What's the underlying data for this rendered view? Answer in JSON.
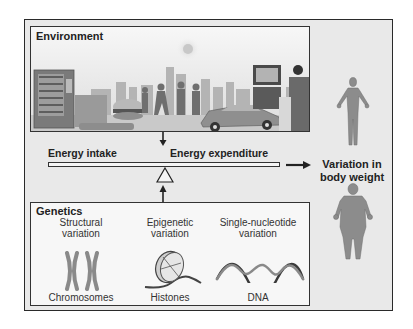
{
  "environment": {
    "title": "Environment",
    "scene_elements": [
      "vending-machine",
      "hamburger",
      "walking-people",
      "city-skyline",
      "sun",
      "car",
      "television",
      "person-sitting"
    ]
  },
  "balance": {
    "left_label": "Energy intake",
    "right_label": "Energy expenditure"
  },
  "outcome": {
    "line1": "Variation in",
    "line2": "body weight"
  },
  "genetics": {
    "title": "Genetics",
    "columns": [
      {
        "heading1": "Structural",
        "heading2": "variation",
        "caption": "Chromosomes",
        "icon": "chromosome-icon"
      },
      {
        "heading1": "Epigenetic",
        "heading2": "variation",
        "caption": "Histones",
        "icon": "histone-icon"
      },
      {
        "heading1": "Single-nucleotide",
        "heading2": "variation",
        "caption": "DNA",
        "icon": "dna-helix-icon"
      }
    ]
  },
  "colors": {
    "frame_bg": "#e9e9e9",
    "figure_gray": "#8c8c8c",
    "border": "#2a2a2a"
  }
}
